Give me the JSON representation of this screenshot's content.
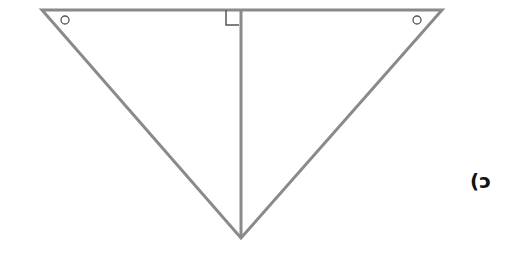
{
  "figure": {
    "label": "(ɔ",
    "stroke_color": "#8a8a8a",
    "triangle": {
      "top_left": [
        42,
        10
      ],
      "top_right": [
        442,
        10
      ],
      "bottom": [
        241,
        238
      ],
      "altitude_foot": [
        241,
        10
      ]
    },
    "markers": {
      "right_angle": "right-angle-mark at altitude foot",
      "equal_angles": [
        "circle mark at top-left vertex",
        "circle mark at top-right vertex"
      ]
    }
  }
}
